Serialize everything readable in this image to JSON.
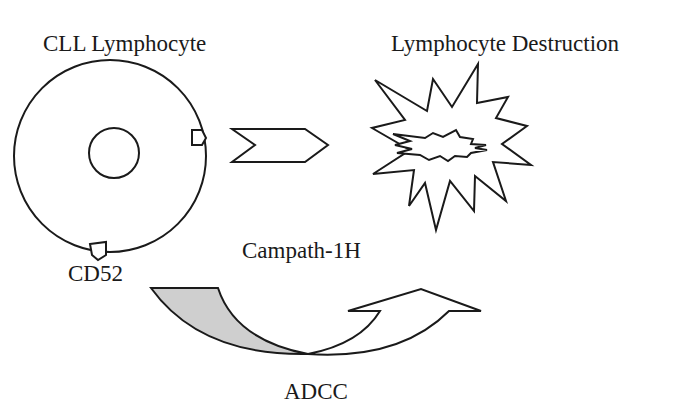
{
  "diagram": {
    "labels": {
      "cll_lymphocyte": "CLL Lymphocyte",
      "lymphocyte_destruction": "Lymphocyte Destruction",
      "cd52": "CD52",
      "campath": "Campath-1H",
      "adcc": "ADCC"
    },
    "colors": {
      "stroke": "#1a1a1a",
      "background": "#ffffff",
      "shaded_fill": "#cfcfcf"
    },
    "nodes": [
      {
        "id": "cll-cell",
        "shape": "circle-with-nucleus",
        "label": "CLL Lymphocyte"
      },
      {
        "id": "cd52-antigen",
        "shape": "pentagon",
        "label": "CD52"
      },
      {
        "id": "process-arrow",
        "shape": "chevron-right"
      },
      {
        "id": "destruction",
        "shape": "explosion-star",
        "label": "Lymphocyte Destruction"
      },
      {
        "id": "adcc-arrow",
        "shape": "curved-up-arrow",
        "label": "ADCC"
      }
    ],
    "edges": [
      {
        "from": "cll-cell",
        "to": "destruction",
        "via": "process-arrow"
      }
    ]
  }
}
